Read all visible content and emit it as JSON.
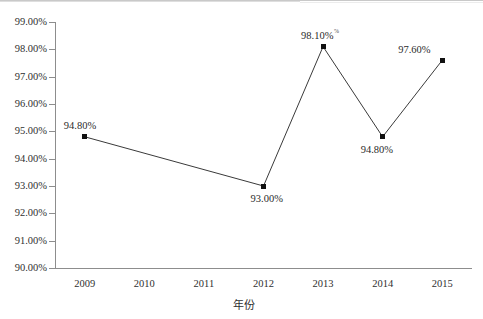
{
  "chart_data": {
    "type": "line",
    "title": "",
    "subtitle": "",
    "xlabel": "年份",
    "ylabel": "",
    "categories": [
      "2009",
      "2010",
      "2011",
      "2012",
      "2013",
      "2014",
      "2015"
    ],
    "series": [
      {
        "name": "",
        "values": [
          94.8,
          null,
          null,
          93.0,
          98.1,
          94.8,
          97.6
        ]
      }
    ],
    "point_labels": [
      "94.80%",
      "",
      "",
      "93.00%",
      "98.10%",
      "94.80%",
      "97.60%"
    ],
    "ylim": [
      90.0,
      99.0
    ],
    "ytick_step": 1.0,
    "ytick_labels": [
      "99.00%",
      "98.00%",
      "97.00%",
      "96.00%",
      "95.00%",
      "94.00%",
      "93.00%",
      "92.00%",
      "91.00%",
      "90.00%"
    ],
    "ytick_values": [
      99,
      98,
      97,
      96,
      95,
      94,
      93,
      92,
      91,
      90
    ],
    "xtick_labels": [
      "2009",
      "2010",
      "2011",
      "2012",
      "2013",
      "2014",
      "2015"
    ],
    "grid": false,
    "legend": "none",
    "marker": "square",
    "marker_color": "#111111",
    "line_color": "#3a3a3a",
    "axis_color": "#8d8d8d",
    "label_artifact": "%"
  }
}
